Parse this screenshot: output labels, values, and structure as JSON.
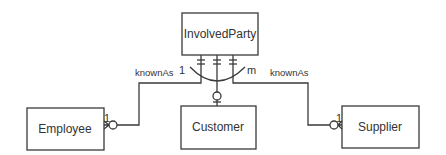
{
  "diagram": {
    "type": "entity-relationship",
    "entities": [
      {
        "id": "involvedparty",
        "label": "InvolvedParty"
      },
      {
        "id": "employee",
        "label": "Employee"
      },
      {
        "id": "customer",
        "label": "Customer"
      },
      {
        "id": "supplier",
        "label": "Supplier"
      }
    ],
    "relationships": [
      {
        "from": "InvolvedParty",
        "to": "Employee",
        "label": "knownAs",
        "cardinality_near_employee": "1"
      },
      {
        "from": "InvolvedParty",
        "to": "Customer",
        "label": ""
      },
      {
        "from": "InvolvedParty",
        "to": "Supplier",
        "label": "knownAs",
        "cardinality_near_supplier": "1"
      }
    ],
    "arc": {
      "left_label": "1",
      "right_label": "m"
    },
    "labels": {
      "known_as_left": "knownAs",
      "known_as_right": "knownAs",
      "arc_one": "1",
      "arc_many": "m",
      "employee_card": "1",
      "supplier_card": "1"
    },
    "colors": {
      "stroke": "#3a3a3a",
      "text": "#333333",
      "background": "#ffffff"
    }
  }
}
